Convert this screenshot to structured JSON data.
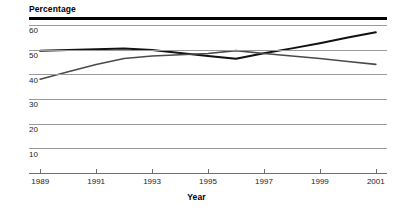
{
  "chart_data": {
    "type": "line",
    "title": "",
    "xlabel": "Year",
    "ylabel": "Percentage",
    "x": [
      1989,
      1990,
      1991,
      1992,
      1993,
      1994,
      1995,
      1996,
      1997,
      1998,
      1999,
      2000,
      2001
    ],
    "xlim": [
      1988.6,
      2001.4
    ],
    "ylim": [
      0,
      62
    ],
    "xticks": [
      1989,
      1991,
      1993,
      1995,
      1997,
      1999,
      2001
    ],
    "xtick_labels": [
      "1989",
      "1991",
      "1993",
      "1995",
      "1997",
      "1999",
      "2001"
    ],
    "yticks": [
      10,
      20,
      30,
      40,
      50,
      60
    ],
    "ytick_labels": [
      "10",
      "20",
      "30",
      "40",
      "50",
      "60"
    ],
    "grid": true,
    "legend": false,
    "legend_position": "none",
    "series": [
      {
        "name": "series-1",
        "color": "#111111",
        "width": 2.0,
        "values": [
          49.5,
          49.8,
          50.1,
          50.5,
          49.8,
          48.6,
          47.4,
          46.3,
          48.5,
          50.5,
          52.6,
          54.9,
          57.0
        ]
      },
      {
        "name": "series-2",
        "color": "#4a4a4a",
        "width": 1.6,
        "values": [
          38.0,
          41.0,
          44.0,
          46.4,
          47.4,
          47.9,
          48.4,
          49.6,
          48.4,
          47.4,
          46.4,
          45.2,
          44.0
        ]
      }
    ]
  },
  "axis": {
    "y_title": "Percentage",
    "x_title": "Year"
  }
}
